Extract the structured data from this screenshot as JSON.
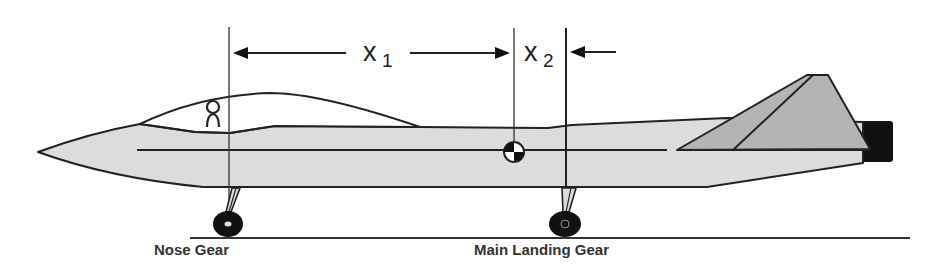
{
  "diagram": {
    "dimensions": {
      "x1": {
        "symbol": "x",
        "subscript": "1",
        "from": "Nose Gear",
        "to": "Center of Gravity"
      },
      "x2": {
        "symbol": "x",
        "subscript": "2",
        "from": "Center of Gravity",
        "to": "Main Landing Gear"
      }
    },
    "labels": {
      "nose_gear": "Nose Gear",
      "main_gear": "Main Landing Gear"
    },
    "symbols": {
      "cg": "center-of-gravity-icon",
      "pilot": "pilot-icon"
    },
    "colors": {
      "fuselage": "#dcdcdc",
      "fin": "#b4b4b4",
      "nozzle": "#111111",
      "line": "#222222",
      "wheel": "#111111"
    }
  }
}
